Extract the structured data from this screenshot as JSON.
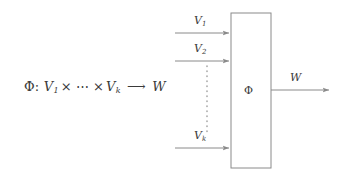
{
  "figure": {
    "caption_formula": {
      "map_symbol": "Φ",
      "colon": ":",
      "domain_first": "V",
      "domain_first_sub": "1",
      "times": "×",
      "ellipsis": "⋯",
      "domain_last": "V",
      "domain_last_sub": "k",
      "arrow": "⟶",
      "codomain": "W"
    },
    "box": {
      "label": "Φ",
      "x": 231,
      "y": 13,
      "width": 40,
      "height": 155,
      "stroke": "#8a8a8a"
    },
    "inputs": [
      {
        "label": "V",
        "sub": "1",
        "y": 33
      },
      {
        "label": "V",
        "sub": "2",
        "y": 61
      },
      {
        "label": "V",
        "sub": "k",
        "y": 148
      }
    ],
    "vertical_dots": {
      "x": 207,
      "y_start": 66,
      "y_end": 134,
      "count": 14
    },
    "output": {
      "label": "W",
      "y": 90,
      "x_start": 271,
      "x_end": 331
    },
    "colors": {
      "line": "#8a8a8a",
      "text": "#3a3a3a",
      "background": "#ffffff"
    }
  }
}
